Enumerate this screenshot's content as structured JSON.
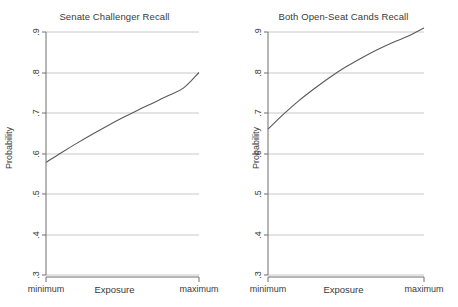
{
  "chart_data": [
    {
      "type": "line",
      "title": "Senate Challenger Recall",
      "xlabel": "Exposure",
      "ylabel": "Probability",
      "ylim": [
        0.3,
        0.9
      ],
      "yticks": [
        ".9",
        ".8",
        ".7",
        ".6",
        ".5",
        ".4",
        ".3"
      ],
      "ytick_values": [
        0.9,
        0.8,
        0.7,
        0.6,
        0.5,
        0.4,
        0.3
      ],
      "xticks": [
        "minimum",
        "maximum"
      ],
      "grid": true,
      "legend": "none",
      "x": [
        0,
        0.1,
        0.2,
        0.3,
        0.4,
        0.5,
        0.6,
        0.7,
        0.8,
        0.9,
        1
      ],
      "values": [
        0.578,
        0.602,
        0.625,
        0.647,
        0.668,
        0.688,
        0.707,
        0.725,
        0.743,
        0.762,
        0.8
      ]
    },
    {
      "type": "line",
      "title": "Both Open-Seat Cands Recall",
      "xlabel": "Exposure",
      "ylabel": "Probability",
      "ylim": [
        0.3,
        0.9
      ],
      "yticks": [
        ".9",
        ".8",
        ".7",
        ".6",
        ".5",
        ".4",
        ".3"
      ],
      "ytick_values": [
        0.9,
        0.8,
        0.7,
        0.6,
        0.5,
        0.4,
        0.3
      ],
      "xticks": [
        "minimum",
        "maximum"
      ],
      "grid": true,
      "legend": "none",
      "x": [
        0,
        0.1,
        0.2,
        0.3,
        0.4,
        0.5,
        0.6,
        0.7,
        0.8,
        0.9,
        1
      ],
      "values": [
        0.66,
        0.697,
        0.731,
        0.761,
        0.789,
        0.814,
        0.836,
        0.856,
        0.874,
        0.89,
        0.91
      ]
    }
  ],
  "panels": [
    {
      "title": "Senate Challenger Recall",
      "ylabel": "Probability",
      "xlabel": "Exposure",
      "xmin_label": "minimum",
      "xmax_label": "maximum",
      "yticks": [
        ".9",
        ".8",
        ".7",
        ".6",
        ".5",
        ".4",
        ".3"
      ]
    },
    {
      "title": "Both Open-Seat Cands Recall",
      "ylabel": "Probability",
      "xlabel": "Exposure",
      "xmin_label": "minimum",
      "xmax_label": "maximum",
      "yticks": [
        ".9",
        ".8",
        ".7",
        ".6",
        ".5",
        ".4",
        ".3"
      ]
    }
  ],
  "colors": {
    "line": "#595959",
    "grid": "#c8c8c8",
    "axis": "#6e6e6e",
    "text": "#3a3a3a",
    "background": "#ffffff"
  }
}
